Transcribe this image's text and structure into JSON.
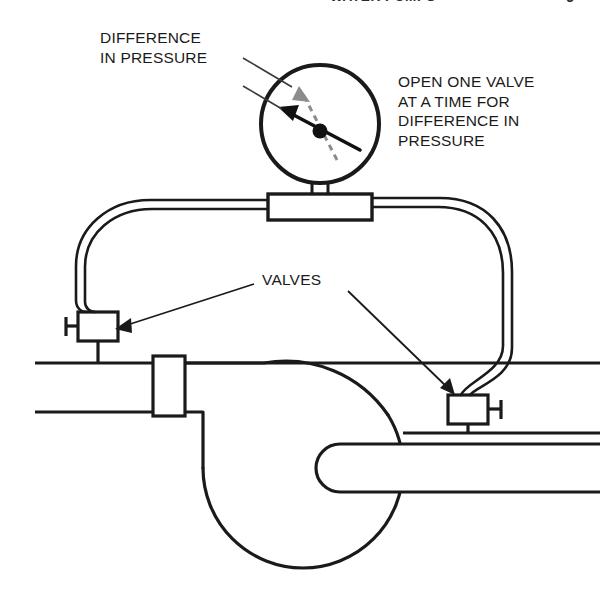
{
  "header": {
    "title": "WATER PUMPS",
    "page_number": "9"
  },
  "labels": {
    "difference_in_pressure": "DIFFERENCE\nIN PRESSURE",
    "open_one_valve": "OPEN ONE VALVE\nAT A TIME FOR\nDIFFERENCE IN\nPRESSURE",
    "valves": "VALVES"
  },
  "colors": {
    "line": "#1a1a1a",
    "background": "#ffffff",
    "needle": "#111111",
    "dashed_needle": "#8c8c8c",
    "leader": "#3a3a3a"
  },
  "diagram": {
    "type": "line-drawing",
    "components": [
      {
        "name": "pressure-gauge",
        "shape": "circle",
        "cx": 320,
        "cy": 124,
        "r": 60
      },
      {
        "name": "gauge-needle",
        "direction": "upper-left",
        "style": "solid"
      },
      {
        "name": "gauge-dashed-needle",
        "direction": "upper-left",
        "style": "dashed"
      },
      {
        "name": "gauge-stem",
        "from": [
          320,
          184
        ],
        "to": [
          320,
          196
        ]
      },
      {
        "name": "tee-block",
        "x": 268,
        "y": 194,
        "width": 104,
        "height": 26
      },
      {
        "name": "left-hose",
        "from": "tee-block-left",
        "to": "left-valve"
      },
      {
        "name": "right-hose",
        "from": "tee-block-right",
        "to": "right-valve"
      },
      {
        "name": "left-valve",
        "x": 78,
        "y": 312,
        "width": 40,
        "height": 29,
        "handle_side": "left"
      },
      {
        "name": "right-valve",
        "x": 448,
        "y": 395,
        "width": 40,
        "height": 29,
        "handle_side": "right"
      },
      {
        "name": "discharge-pipe",
        "top_y": 363,
        "bottom_y": 412,
        "from_x": 35,
        "to_x": 600
      },
      {
        "name": "pipe-flange",
        "x": 153,
        "y": 356,
        "width": 32,
        "height": 60
      },
      {
        "name": "pump-volute",
        "shape": "circle",
        "cx": 303,
        "cy": 468,
        "r": 100
      },
      {
        "name": "suction-inlet",
        "from_x": 600,
        "to_x": 322,
        "y": 460
      }
    ],
    "leaders": [
      {
        "name": "gauge-leader-upper",
        "from": [
          243,
          60
        ],
        "to": [
          291,
          86
        ],
        "style": "thin"
      },
      {
        "name": "gauge-leader-lower",
        "from": [
          243,
          85
        ],
        "to": [
          281,
          108
        ],
        "style": "thin"
      },
      {
        "name": "valves-leader-left",
        "from": [
          252,
          284
        ],
        "to": [
          118,
          327
        ],
        "arrow": true
      },
      {
        "name": "valves-leader-right",
        "from": [
          348,
          291
        ],
        "to": [
          452,
          392
        ],
        "arrow": true
      }
    ]
  }
}
